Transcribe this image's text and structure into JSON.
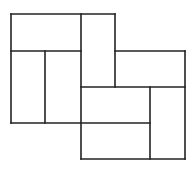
{
  "diagram": {
    "title": "",
    "background": "#ffffff",
    "stroke": "#222222",
    "stroke_width": 1.6,
    "width": 195,
    "height": 171,
    "segments": [
      {
        "name": "left-square-top",
        "x1": 11,
        "y1": 14,
        "x2": 115,
        "y2": 14
      },
      {
        "name": "left-square-left",
        "x1": 11,
        "y1": 14,
        "x2": 11,
        "y2": 123
      },
      {
        "name": "left-upper-divider",
        "x1": 11,
        "y1": 51,
        "x2": 81,
        "y2": 51
      },
      {
        "name": "left-lower-split",
        "x1": 45,
        "y1": 51,
        "x2": 45,
        "y2": 123
      },
      {
        "name": "center-vertical",
        "x1": 81,
        "y1": 14,
        "x2": 81,
        "y2": 159
      },
      {
        "name": "top-tall-cell-right",
        "x1": 115,
        "y1": 14,
        "x2": 115,
        "y2": 87
      },
      {
        "name": "right-upper-top",
        "x1": 115,
        "y1": 51,
        "x2": 185,
        "y2": 51
      },
      {
        "name": "right-square-right",
        "x1": 185,
        "y1": 51,
        "x2": 185,
        "y2": 159
      },
      {
        "name": "middle-horizontal",
        "x1": 81,
        "y1": 87,
        "x2": 185,
        "y2": 87
      },
      {
        "name": "right-lower-split",
        "x1": 150,
        "y1": 87,
        "x2": 150,
        "y2": 159
      },
      {
        "name": "lower-horizontal",
        "x1": 11,
        "y1": 123,
        "x2": 150,
        "y2": 123
      },
      {
        "name": "right-square-bottom",
        "x1": 81,
        "y1": 159,
        "x2": 185,
        "y2": 159
      }
    ]
  }
}
